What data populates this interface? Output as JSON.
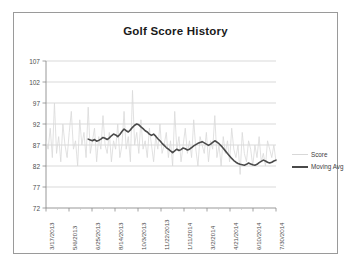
{
  "chart_data": {
    "type": "line",
    "title": "Golf Score History",
    "xlabel": "",
    "ylabel": "",
    "ylim": [
      72,
      107
    ],
    "y_ticks": [
      72,
      77,
      82,
      87,
      92,
      97,
      102,
      107
    ],
    "grid": true,
    "legend_position": "right",
    "x_tick_labels": [
      "3/17/2013",
      "5/6/2013",
      "6/25/2013",
      "8/14/2013",
      "10/3/2013",
      "11/22/2013",
      "1/11/2014",
      "3/2/2014",
      "4/21/2014",
      "6/10/2014",
      "7/30/2014"
    ],
    "x_range": [
      "3/17/2013",
      "7/30/2014"
    ],
    "series": [
      {
        "name": "Score",
        "color": "#d9d9d9",
        "width": 0.8,
        "values": [
          88,
          86,
          91,
          84,
          97,
          85,
          89,
          83,
          92,
          87,
          84,
          90,
          95,
          86,
          88,
          82,
          93,
          87,
          90,
          84,
          96,
          85,
          88,
          91,
          83,
          89,
          86,
          94,
          87,
          85,
          90,
          83,
          88,
          86,
          92,
          84,
          87,
          95,
          86,
          89,
          83,
          100,
          87,
          90,
          85,
          93,
          86,
          88,
          84,
          91,
          87,
          83,
          89,
          86,
          92,
          85,
          87,
          90,
          84,
          88,
          82,
          95,
          86,
          89,
          83,
          87,
          91,
          85,
          88,
          84,
          93,
          86,
          82,
          89,
          87,
          85,
          90,
          83,
          88,
          86,
          94,
          84,
          87,
          82,
          89,
          85,
          88,
          83,
          91,
          86,
          84,
          87,
          80,
          90,
          85,
          83,
          88,
          86,
          82,
          87,
          84,
          89,
          83,
          85,
          82,
          88,
          86,
          84,
          87,
          83
        ]
      },
      {
        "name": "Moving Avg",
        "color": "#4a4a4a",
        "width": 1.6,
        "values": [
          null,
          null,
          null,
          null,
          null,
          null,
          null,
          null,
          null,
          null,
          null,
          null,
          null,
          null,
          null,
          null,
          null,
          null,
          null,
          null,
          88.4,
          88.2,
          88.0,
          88.3,
          87.9,
          88.1,
          88.4,
          88.8,
          88.6,
          88.3,
          88.7,
          89.2,
          89.6,
          89.4,
          89.0,
          89.5,
          90.2,
          90.8,
          90.4,
          90.1,
          90.6,
          91.2,
          91.7,
          92.0,
          91.8,
          91.3,
          90.9,
          90.4,
          90.1,
          89.6,
          89.3,
          89.6,
          89.1,
          88.5,
          88.0,
          87.4,
          86.9,
          86.4,
          86.0,
          85.6,
          85.2,
          85.6,
          86.0,
          85.7,
          85.9,
          86.3,
          86.1,
          85.8,
          86.0,
          86.4,
          86.8,
          87.1,
          87.4,
          87.6,
          87.8,
          87.5,
          87.2,
          86.9,
          87.2,
          87.6,
          88.0,
          87.7,
          87.3,
          86.8,
          86.2,
          85.6,
          85.0,
          84.4,
          83.8,
          83.3,
          82.9,
          82.6,
          82.4,
          82.3,
          82.2,
          82.4,
          82.7,
          82.5,
          82.3,
          82.2,
          82.4,
          82.8,
          83.1,
          83.4,
          83.2,
          82.9,
          82.7,
          82.9,
          83.2,
          83.4
        ]
      }
    ]
  },
  "legend": {
    "items": [
      {
        "label": "Score"
      },
      {
        "label": "Moving Avg"
      }
    ]
  },
  "colors": {
    "score": "#d9d9d9",
    "moving_avg": "#4a4a4a",
    "grid": "#c9c9c9",
    "axis": "#8c8c8c",
    "frame": "#9a9a9a",
    "text": "#3d3d3d"
  }
}
